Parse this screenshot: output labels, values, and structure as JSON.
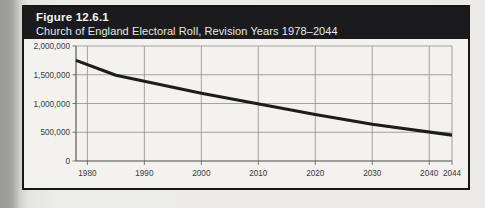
{
  "figure": {
    "number_label": "Figure 12.6.1",
    "caption": "Church of England Electoral Roll, Revision Years 1978–2044",
    "header_bg": "#1b1b1e",
    "header_text_color": "#f4f4f2"
  },
  "chart_data": {
    "type": "line",
    "title": "Church of England Electoral Roll, Revision Years 1978–2044",
    "xlabel": "",
    "ylabel": "",
    "xlim": [
      1978,
      2044
    ],
    "ylim": [
      0,
      2000000
    ],
    "grid": true,
    "legend": null,
    "line_color": "#1d1d1f",
    "y_ticks": [
      0,
      500000,
      1000000,
      1500000,
      2000000
    ],
    "y_tick_labels": [
      "0",
      "500,000",
      "1,000,000",
      "1,500,000",
      "2,000,000"
    ],
    "x_ticks": [
      1980,
      1990,
      2000,
      2010,
      2020,
      2030,
      2040,
      2044
    ],
    "x_tick_labels": [
      "1980",
      "1990",
      "2000",
      "2010",
      "2020",
      "2030",
      "2040",
      "2044"
    ],
    "series": [
      {
        "name": "Electoral Roll",
        "x": [
          1978,
          1985,
          2000,
          2020,
          2030,
          2044
        ],
        "values": [
          1750000,
          1490000,
          1180000,
          810000,
          640000,
          450000
        ]
      }
    ]
  }
}
